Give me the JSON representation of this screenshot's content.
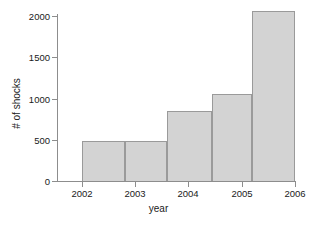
{
  "chart_data": {
    "type": "bar",
    "title": "",
    "xlabel": "year",
    "ylabel": "# of shocks",
    "categories": [
      "2002",
      "2003",
      "2004",
      "2005",
      "2006"
    ],
    "bins": [
      {
        "x_start": 2002.0,
        "x_end": 2002.8,
        "value": 480
      },
      {
        "x_start": 2002.8,
        "x_end": 2003.6,
        "value": 490
      },
      {
        "x_start": 2003.6,
        "x_end": 2004.45,
        "value": 845
      },
      {
        "x_start": 2004.45,
        "x_end": 2005.2,
        "value": 1055
      },
      {
        "x_start": 2005.2,
        "x_end": 2006.0,
        "value": 2065
      }
    ],
    "values": [
      480,
      490,
      845,
      1055,
      2065
    ],
    "xlim": [
      2001.6,
      2006.0
    ],
    "ylim": [
      0,
      2150
    ],
    "y_ticks": [
      "0",
      "500",
      "1000",
      "1500",
      "2000"
    ],
    "y_tick_values": [
      0,
      500,
      1000,
      1500,
      2000
    ],
    "x_ticks": [
      "2002",
      "2003",
      "2004",
      "2005",
      "2006"
    ],
    "x_tick_values": [
      2002,
      2003,
      2004,
      2005,
      2006
    ],
    "grid": false,
    "legend": false,
    "bar_fill_color": "#d3d3d3",
    "bar_edge_color": "#9a9a9a",
    "axis_color": "#8d8d8d"
  }
}
